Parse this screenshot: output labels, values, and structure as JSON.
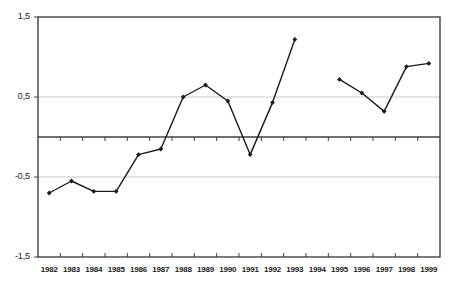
{
  "chart_data": {
    "type": "line",
    "title": "",
    "subtitle": "",
    "xlabel": "",
    "ylabel": "",
    "x": [
      1982,
      1983,
      1984,
      1985,
      1986,
      1987,
      1988,
      1989,
      1990,
      1991,
      1992,
      1993,
      1994,
      1995,
      1996,
      1997,
      1998,
      1999
    ],
    "categories": [
      "1982",
      "1983",
      "1984",
      "1985",
      "1986",
      "1987",
      "1988",
      "1989",
      "1990",
      "1991",
      "1992",
      "1993",
      "1994",
      "1995",
      "1996",
      "1997",
      "1998",
      "1999"
    ],
    "values": [
      -0.7,
      -0.55,
      -0.68,
      -0.68,
      -0.22,
      -0.15,
      0.5,
      0.65,
      0.45,
      -0.22,
      0.43,
      1.22,
      null,
      0.72,
      0.55,
      0.32,
      0.88,
      0.92
    ],
    "series": [
      {
        "name": "series-1",
        "values": [
          -0.7,
          -0.55,
          -0.68,
          -0.68,
          -0.22,
          -0.15,
          0.5,
          0.65,
          0.45,
          -0.22,
          0.43,
          1.22,
          null,
          0.72,
          0.55,
          0.32,
          0.88,
          0.92
        ],
        "color": "#1a1a1a",
        "marker": "diamond"
      }
    ],
    "ylim": [
      -1.5,
      1.5
    ],
    "yticks": [
      -1.5,
      -0.5,
      0.5,
      1.5
    ],
    "ytick_labels": [
      "-1,5",
      "-0,5",
      "0,5",
      "1,5"
    ],
    "gridlines": [
      -0.5,
      0.5
    ],
    "grid": true,
    "zero_line": 0,
    "legend": false,
    "legend_position": "none",
    "annotations": []
  },
  "axis": {
    "y_tick_labels": [
      "1,5",
      "0,5",
      "-0,5",
      "-1,5"
    ],
    "y_tick_values": [
      1.5,
      0.5,
      -0.5,
      -1.5
    ],
    "x_tick_labels": [
      "1982",
      "1983",
      "1984",
      "1985",
      "1986",
      "1987",
      "1988",
      "1989",
      "1990",
      "1991",
      "1992",
      "1993",
      "1994",
      "1995",
      "1996",
      "1997",
      "1998",
      "1999"
    ]
  },
  "colors": {
    "frame": "#404040",
    "gridline": "#c8c8c8",
    "zero_axis": "#404040",
    "line": "#1a1a1a",
    "marker": "#1a1a1a",
    "background": "#ffffff",
    "text": "#1a1a1a"
  }
}
